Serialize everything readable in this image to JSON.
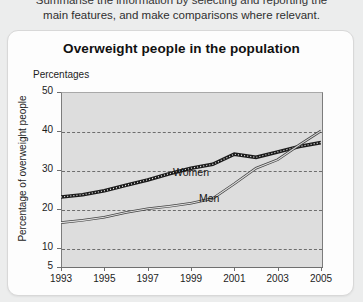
{
  "instructions": {
    "line1": "Summarise the information by selecting and reporting the",
    "line2": "main features, and make comparisons where relevant."
  },
  "card": {
    "title": "Overweight people in the population"
  },
  "chart_data": {
    "type": "line",
    "title": "Overweight people in the population",
    "unit_label": "Percentages",
    "xlabel": "",
    "ylabel": "Percentage of overweight people",
    "xlim": [
      1993,
      2005
    ],
    "ylim": [
      5,
      50
    ],
    "grid": true,
    "gridlines": [
      10,
      20,
      30,
      40
    ],
    "legend_position": "inline-annotation",
    "ytick_labels": [
      "5",
      "10",
      "20",
      "30",
      "40",
      "50"
    ],
    "ytick_values": [
      5,
      10,
      20,
      30,
      40,
      50
    ],
    "xtick_labels": [
      "1993",
      "1995",
      "1997",
      "1999",
      "2001",
      "2003",
      "2005"
    ],
    "xtick_values": [
      1993,
      1995,
      1997,
      1999,
      2001,
      2003,
      2005
    ],
    "x": [
      1993,
      1994,
      1995,
      1996,
      1997,
      1998,
      1999,
      2000,
      2001,
      2002,
      2003,
      2004,
      2005
    ],
    "series": [
      {
        "name": "Women",
        "style": "thick-dotted",
        "color": "#1b1b1b",
        "values": [
          23.0,
          23.6,
          24.6,
          26.0,
          27.4,
          29.0,
          30.4,
          31.4,
          34.0,
          33.2,
          34.6,
          36.0,
          37.0
        ]
      },
      {
        "name": "Men",
        "style": "thin-double",
        "color": "#444444",
        "values": [
          16.4,
          17.0,
          17.8,
          19.0,
          20.0,
          20.6,
          21.4,
          22.6,
          26.4,
          30.4,
          32.6,
          36.4,
          40.0
        ]
      }
    ],
    "annotations": [
      {
        "text": "Women",
        "x": 1999.0,
        "y": 33.0
      },
      {
        "text": "Men",
        "x": 2000.3,
        "y": 26.2
      }
    ]
  }
}
